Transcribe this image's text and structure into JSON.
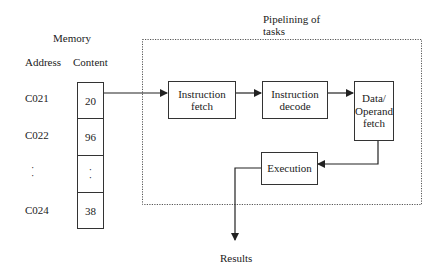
{
  "memory": {
    "title": "Memory",
    "address_header": "Address",
    "content_header": "Content",
    "rows": [
      {
        "address": "C021",
        "content": "20"
      },
      {
        "address": "C022",
        "content": "96"
      },
      {
        "address": "·\n·",
        "content": "·\n·"
      },
      {
        "address": "C024",
        "content": "38"
      }
    ]
  },
  "pipeline": {
    "label_line1": "Pipelining of",
    "label_line2": "tasks",
    "stages": {
      "instruction_fetch": {
        "line1": "Instruction",
        "line2": "fetch"
      },
      "instruction_decode": {
        "line1": "Instruction",
        "line2": "decode"
      },
      "operand_fetch": {
        "line1": "Data/",
        "line2": "Operand",
        "line3": "fetch"
      },
      "execution": {
        "line1": "Execution"
      }
    }
  },
  "output": {
    "label": "Results"
  },
  "colors": {
    "stroke": "#333333",
    "dotted": "#555555",
    "text": "#222222"
  }
}
